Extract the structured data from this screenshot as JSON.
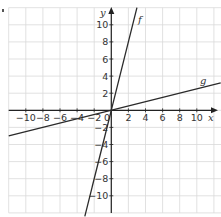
{
  "chart_data": {
    "type": "line",
    "title": "",
    "xlabel": "x",
    "ylabel": "y",
    "xlim": [
      -12,
      12.8
    ],
    "ylim": [
      -12,
      12
    ],
    "grid": true,
    "grid_step": 2,
    "origin_label": "0",
    "x_ticks": [
      -10,
      -8,
      -6,
      -4,
      -2,
      2,
      4,
      6,
      8,
      10
    ],
    "x_tick_labels": [
      "−10",
      "−8",
      "−6",
      "−4",
      "−2",
      "2",
      "4",
      "6",
      "8",
      "10"
    ],
    "y_ticks": [
      10,
      8,
      6,
      4,
      2,
      -2,
      -4,
      -6,
      -8,
      -10
    ],
    "y_tick_labels": [
      "10",
      "8",
      "6",
      "4",
      "2",
      "−2",
      "−4",
      "−6",
      "−8",
      "−10"
    ],
    "series": [
      {
        "name": "f",
        "equation": "y = 4x",
        "slope": 4,
        "intercept": 0,
        "x": [
          -3.1,
          3.0
        ],
        "y": [
          -12.4,
          12.0
        ]
      },
      {
        "name": "g",
        "equation": "y = x/4",
        "slope": 0.25,
        "intercept": 0,
        "x": [
          -12,
          12.8
        ],
        "y": [
          -3.0,
          3.2
        ]
      }
    ]
  },
  "labels": {
    "x_axis": "x",
    "y_axis": "y",
    "f": "f",
    "g": "g",
    "origin": "0"
  },
  "colors": {
    "grid": "#d9d9d9",
    "axis": "#222222",
    "line": "#2a2a2a"
  }
}
